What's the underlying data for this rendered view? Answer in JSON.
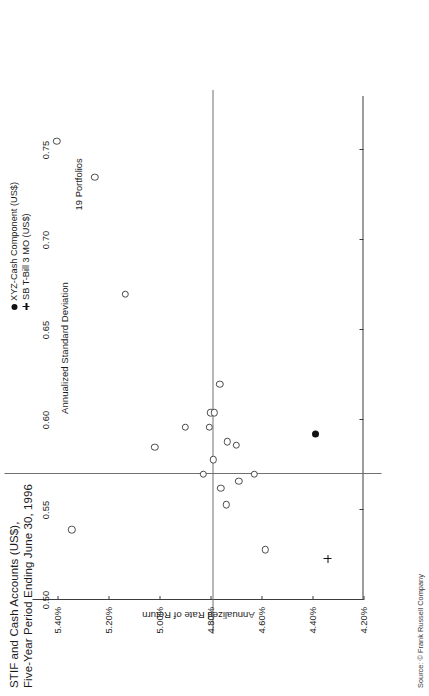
{
  "title": {
    "line1": "STIF and Cash Accounts (US$),",
    "line2": "Five-Year Period Ending June 30, 1996"
  },
  "legend": {
    "items": [
      {
        "marker": "filled-dot",
        "label": "XYZ-Cash Component (US$)"
      },
      {
        "marker": "plus",
        "label": "SB T-Bill 3 MO (US$)"
      }
    ]
  },
  "annotations": {
    "portfolio_count": "19 Portfolios"
  },
  "source": "Source: © Frank Russell Company",
  "chart_data": {
    "type": "scatter",
    "title": "STIF and Cash Accounts (US$), Five-Year Period Ending June 30, 1996",
    "xlabel": "Annualized Standard Deviation",
    "ylabel": "Annualized Rate of Return",
    "xlim": [
      0.5,
      0.78
    ],
    "ylim": [
      4.2,
      5.5
    ],
    "xticks": [
      0.5,
      0.55,
      0.6,
      0.65,
      0.7,
      0.75
    ],
    "xticklabels": [
      "0.50",
      "0.55",
      "0.60",
      "0.65",
      "0.70",
      "0.75"
    ],
    "yticks": [
      4.2,
      4.4,
      4.6,
      4.8,
      5.0,
      5.2,
      5.4
    ],
    "yticklabels": [
      "4.20%",
      "4.40%",
      "4.60%",
      "4.80%",
      "5.00%",
      "5.20%",
      "5.40%"
    ],
    "grid": false,
    "legend_position": "top-right",
    "median_lines": {
      "x": 0.57,
      "y": 4.795
    },
    "series": [
      {
        "name": "Portfolios",
        "marker": "open-circle",
        "points": [
          {
            "x": 0.539,
            "y": 5.345
          },
          {
            "x": 0.585,
            "y": 5.02
          },
          {
            "x": 0.67,
            "y": 5.135
          },
          {
            "x": 0.755,
            "y": 5.405
          },
          {
            "x": 0.735,
            "y": 5.255
          },
          {
            "x": 0.57,
            "y": 4.83
          },
          {
            "x": 0.578,
            "y": 4.79
          },
          {
            "x": 0.596,
            "y": 4.805
          },
          {
            "x": 0.604,
            "y": 4.8
          },
          {
            "x": 0.604,
            "y": 4.785
          },
          {
            "x": 0.62,
            "y": 4.765
          },
          {
            "x": 0.588,
            "y": 4.735
          },
          {
            "x": 0.553,
            "y": 4.74
          },
          {
            "x": 0.586,
            "y": 4.7
          },
          {
            "x": 0.566,
            "y": 4.69
          },
          {
            "x": 0.57,
            "y": 4.63
          },
          {
            "x": 0.528,
            "y": 4.585
          },
          {
            "x": 0.596,
            "y": 4.9
          },
          {
            "x": 0.562,
            "y": 4.76
          }
        ]
      },
      {
        "name": "XYZ-Cash Component (US$)",
        "marker": "filled-dot",
        "points": [
          {
            "x": 0.592,
            "y": 4.39
          }
        ]
      },
      {
        "name": "SB T-Bill 3 MO (US$)",
        "marker": "plus",
        "points": [
          {
            "x": 0.523,
            "y": 4.34
          }
        ]
      }
    ]
  }
}
